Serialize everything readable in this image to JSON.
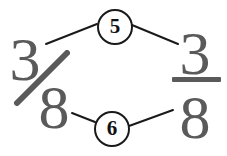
{
  "diagram": {
    "kind": "fraction-annotation-diagram",
    "background_color": "#ffffff",
    "ink_color": "#5a5a5a",
    "callout_color": "#111111",
    "left_fraction": {
      "name": "slanted-fraction",
      "numerator": "3",
      "denominator": "8",
      "separator": "slash",
      "value_text": "3/8"
    },
    "right_fraction": {
      "name": "stacked-fraction",
      "numerator": "3",
      "denominator": "8",
      "separator": "horizontal-bar",
      "value_text": "3/8"
    },
    "callouts": [
      {
        "id": "callout-top",
        "label": "5",
        "position": "top-center",
        "connects": [
          "left-fraction-numerator",
          "right-fraction-numerator"
        ]
      },
      {
        "id": "callout-bottom",
        "label": "6",
        "position": "bottom-center",
        "connects": [
          "left-fraction-denominator",
          "right-fraction-denominator"
        ]
      }
    ],
    "connectors": [
      {
        "id": "connector-top-left",
        "from": "callout-top",
        "to": "left-fraction",
        "x1": 97,
        "y1": 24,
        "x2": 46,
        "y2": 44
      },
      {
        "id": "connector-top-right",
        "from": "callout-top",
        "to": "right-fraction",
        "x1": 132,
        "y1": 25,
        "x2": 178,
        "y2": 44
      },
      {
        "id": "connector-bottom-left",
        "from": "callout-bottom",
        "to": "left-fraction",
        "x1": 95,
        "y1": 122,
        "x2": 72,
        "y2": 113
      },
      {
        "id": "connector-bottom-right",
        "from": "callout-bottom",
        "to": "right-fraction",
        "x1": 129,
        "y1": 126,
        "x2": 173,
        "y2": 110
      }
    ]
  }
}
